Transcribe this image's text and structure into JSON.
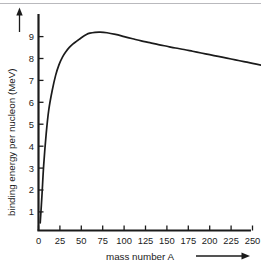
{
  "figure": {
    "background_color": "#ffffff",
    "ink_color": "#1b1b1b",
    "border_color": "#b9b9bd"
  },
  "axes": {
    "x": {
      "title": "mass number A",
      "tick_labels": [
        "0",
        "25",
        "50",
        "75",
        "100",
        "125",
        "150",
        "175",
        "200",
        "225",
        "250"
      ],
      "arrow_name": "x-axis-arrow"
    },
    "y": {
      "title": "binding energy per nucleon (MeV)",
      "tick_labels": [
        "1",
        "2",
        "3",
        "4",
        "5",
        "6",
        "7",
        "8",
        "9"
      ],
      "arrow_name": "y-axis-arrow"
    }
  },
  "chart_data": {
    "type": "line",
    "title": "",
    "xlabel": "mass number A",
    "ylabel": "binding energy per nucleon (MeV)",
    "xlim": [
      0,
      265
    ],
    "ylim": [
      0,
      9.8
    ],
    "xticks": [
      0,
      25,
      50,
      75,
      100,
      125,
      150,
      175,
      200,
      225,
      250
    ],
    "yticks": [
      1,
      2,
      3,
      4,
      5,
      6,
      7,
      8,
      9
    ],
    "grid": false,
    "legend": false,
    "series": [
      {
        "name": "binding energy per nucleon",
        "x": [
          2,
          4,
          6,
          9,
          12,
          16,
          20,
          24,
          28,
          32,
          36,
          40,
          45,
          50,
          56,
          60,
          66,
          72,
          80,
          90,
          100,
          110,
          120,
          130,
          140,
          150,
          160,
          170,
          180,
          190,
          200,
          210,
          220,
          230,
          240,
          250,
          260,
          265
        ],
        "y": [
          0.35,
          1.6,
          3.0,
          4.5,
          5.6,
          6.5,
          7.2,
          7.7,
          8.05,
          8.3,
          8.5,
          8.65,
          8.8,
          8.95,
          9.1,
          9.16,
          9.2,
          9.21,
          9.18,
          9.1,
          9.0,
          8.9,
          8.8,
          8.72,
          8.63,
          8.55,
          8.47,
          8.4,
          8.32,
          8.24,
          8.16,
          8.08,
          8.0,
          7.92,
          7.84,
          7.76,
          7.67,
          7.62
        ]
      }
    ],
    "annotations": {
      "peak_value": 9.21,
      "peak_mass_number": 72,
      "end_value": 7.62,
      "end_mass_number": 265
    }
  }
}
